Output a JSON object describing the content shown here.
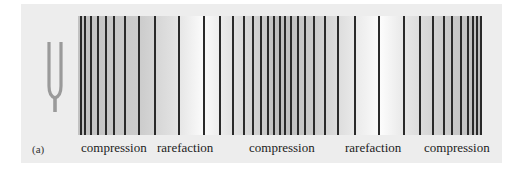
{
  "figure": {
    "panel_label": "(a)",
    "object": "tuning-fork",
    "labels": [
      {
        "text": "compression",
        "x": 81
      },
      {
        "text": "rarefaction",
        "x": 157
      },
      {
        "text": "compression",
        "x": 249
      },
      {
        "text": "rarefaction",
        "x": 345
      },
      {
        "text": "compression",
        "x": 424
      }
    ],
    "wavefront_lines_x": [
      80,
      84,
      90,
      97,
      105,
      113,
      124,
      138,
      154,
      178,
      203,
      219,
      232,
      243,
      252,
      260,
      267,
      273,
      279,
      284,
      290,
      297,
      304,
      313,
      324,
      337,
      354,
      378,
      403,
      419,
      432,
      443,
      451,
      460,
      467,
      472,
      476,
      480
    ],
    "colors": {
      "line": "#2a2a2a",
      "fork": "#9a9a9a",
      "panel": "#ededed"
    }
  }
}
